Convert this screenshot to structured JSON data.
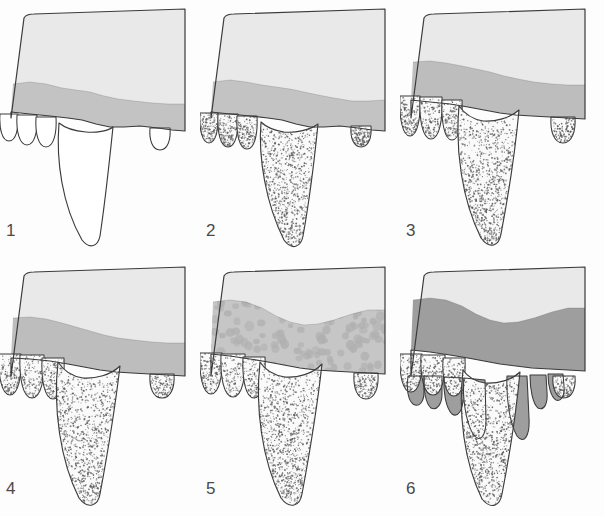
{
  "figure": {
    "background_color": "#fdfdfd",
    "columns": 3,
    "rows": 2,
    "panel_width": 200,
    "panel_height": 258
  },
  "palette": {
    "outline": "#3b3b3b",
    "bone_light": "#e9e9e9",
    "band_light": "#c3c3c3",
    "band_medium": "#bdbdbd",
    "band_dark": "#a8a8a8",
    "band_darkest": "#9e9e9e",
    "tooth_white": "#ffffff",
    "tooth_stipple": "#fafafa",
    "stipple_dot": "#5a5a5a",
    "mottle_blob": "#b0b0b0",
    "number_color": "#4a4a4a",
    "page_background": "#fdfdfd"
  },
  "panels": [
    {
      "number": "1",
      "name": "stage-1",
      "x": 0,
      "y": 0,
      "number_x": 6,
      "number_y": 222,
      "band_color": "#c3c3c3",
      "band_thickness": "thin",
      "teeth_fill": "white",
      "teeth_stippled": false,
      "mottled": false,
      "drips": false,
      "description": "Unstippled white teeth, thin gray band, large canine with broad open root"
    },
    {
      "number": "2",
      "name": "stage-2",
      "x": 200,
      "y": 0,
      "number_x": 206,
      "number_y": 222,
      "band_color": "#c3c3c3",
      "band_thickness": "thin",
      "teeth_fill": "stippled",
      "teeth_stippled": true,
      "mottled": false,
      "drips": false,
      "description": "Teeth acquire dense stippled bone texture, band unchanged"
    },
    {
      "number": "3",
      "name": "stage-3",
      "x": 400,
      "y": 0,
      "number_x": 406,
      "number_y": 222,
      "band_color": "#bdbdbd",
      "band_thickness": "medium",
      "teeth_fill": "stippled",
      "teeth_stippled": true,
      "mottled": false,
      "drips": false,
      "description": "Gray band thickens and rises, teeth more fully erupted"
    },
    {
      "number": "4",
      "name": "stage-4",
      "x": 0,
      "y": 258,
      "number_x": 6,
      "number_y": 480,
      "band_color": "#bdbdbd",
      "band_thickness": "medium",
      "teeth_fill": "stippled",
      "teeth_stippled": true,
      "mottled": false,
      "drips": false,
      "description": "Teeth fully erupted, band with wavy lower margin following tooth crowns"
    },
    {
      "number": "5",
      "name": "stage-5",
      "x": 200,
      "y": 258,
      "number_x": 206,
      "number_y": 480,
      "band_color": "#c6c6c6",
      "band_thickness": "thick",
      "teeth_fill": "stippled",
      "teeth_stippled": true,
      "mottled": true,
      "drips": false,
      "description": "Band greatly thickened and filled with mottled circular blobs"
    },
    {
      "number": "6",
      "name": "stage-6",
      "x": 400,
      "y": 258,
      "number_x": 406,
      "number_y": 480,
      "band_color": "#9e9e9e",
      "band_thickness": "thick",
      "teeth_fill": "stippled",
      "teeth_stippled": true,
      "mottled": false,
      "drips": true,
      "description": "Darkest solid band flowing downward in finger-like drips around each tooth"
    }
  ]
}
